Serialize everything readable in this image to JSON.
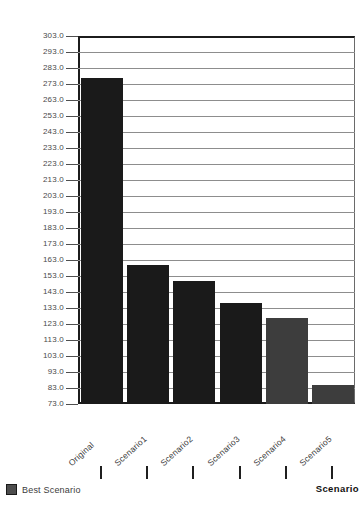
{
  "chart_data": {
    "type": "bar",
    "title": "",
    "subtitle": "",
    "xlabel": "Scenario",
    "ylabel": "",
    "categories": [
      "Original",
      "Scenario1",
      "Scenario2",
      "Scenario3",
      "Scenario4",
      "Scenario5"
    ],
    "values": [
      277,
      160,
      150,
      136,
      127,
      85
    ],
    "series": [
      {
        "name": "Best Scenario",
        "values": [
          277,
          160,
          150,
          136,
          127,
          85
        ],
        "bar_colors": [
          "#1a1a1a",
          "#1a1a1a",
          "#1a1a1a",
          "#1a1a1a",
          "#3d3d3d",
          "#3d3d3d"
        ]
      }
    ],
    "ylim": [
      73,
      303
    ],
    "ytick_step": 10,
    "ytick_labels": [
      "303.0",
      "293.0",
      "283.0",
      "273.0",
      "263.0",
      "253.0",
      "243.0",
      "233.0",
      "223.0",
      "213.0",
      "203.0",
      "193.0",
      "183.0",
      "173.0",
      "163.0",
      "153.0",
      "143.0",
      "133.0",
      "123.0",
      "113.0",
      "103.0",
      "93.0",
      "83.0",
      "73.0"
    ],
    "ytick_values": [
      303,
      293,
      283,
      273,
      263,
      253,
      243,
      233,
      223,
      213,
      203,
      193,
      183,
      173,
      163,
      153,
      143,
      133,
      123,
      113,
      103,
      93,
      83,
      73
    ],
    "grid": true,
    "grid_axis": "y",
    "legend": {
      "position": "bottom-left",
      "entries": [
        {
          "label": "Best Scenario",
          "color": "#4d4d4d"
        }
      ]
    },
    "bar_color_default": "#1a1a1a",
    "bar_color_highlight": "#3d3d3d",
    "plot_background": "#ffffff",
    "axis_color": "#1c1c1c",
    "gridline_color": "#8d8d8d",
    "xlabel_rotation_deg": -42
  }
}
